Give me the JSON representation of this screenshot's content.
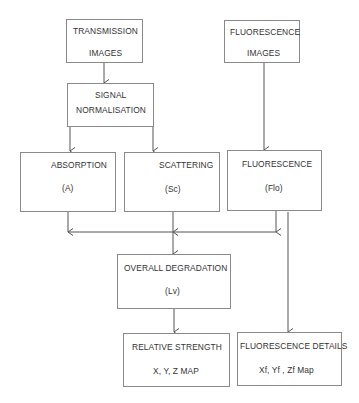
{
  "diagram": {
    "type": "flowchart",
    "line_color": "#555555",
    "nodes": {
      "transmission": {
        "line1": "TRANSMISSION",
        "line2": "IMAGES"
      },
      "fluorescence_images": {
        "line1": "FLUORESCENCE",
        "line2": "IMAGES"
      },
      "normalisation": {
        "line1": "SIGNAL",
        "line2": "NORMALISATION"
      },
      "absorption": {
        "line1": "ABSORPTION",
        "line2": "(A)"
      },
      "scattering": {
        "line1": "SCATTERING",
        "line2": "(Sc)"
      },
      "fluorescence": {
        "line1": "FLUORESCENCE",
        "line2": "(Flo)"
      },
      "overall": {
        "line1": "OVERALL DEGRADATION",
        "line2": "(Lv)"
      },
      "relative": {
        "line1": "RELATIVE STRENGTH",
        "line2": "X, Y, Z MAP"
      },
      "fluo_details": {
        "line1": "FLUORESCENCE DETAILS",
        "line2": "Xf, Yf , Zf Map"
      }
    },
    "edges": [
      [
        "transmission",
        "normalisation"
      ],
      [
        "normalisation",
        "absorption"
      ],
      [
        "normalisation",
        "scattering"
      ],
      [
        "fluorescence_images",
        "fluorescence"
      ],
      [
        "absorption",
        "overall"
      ],
      [
        "scattering",
        "overall"
      ],
      [
        "fluorescence",
        "overall"
      ],
      [
        "overall",
        "relative"
      ],
      [
        "fluorescence",
        "fluo_details"
      ]
    ]
  }
}
